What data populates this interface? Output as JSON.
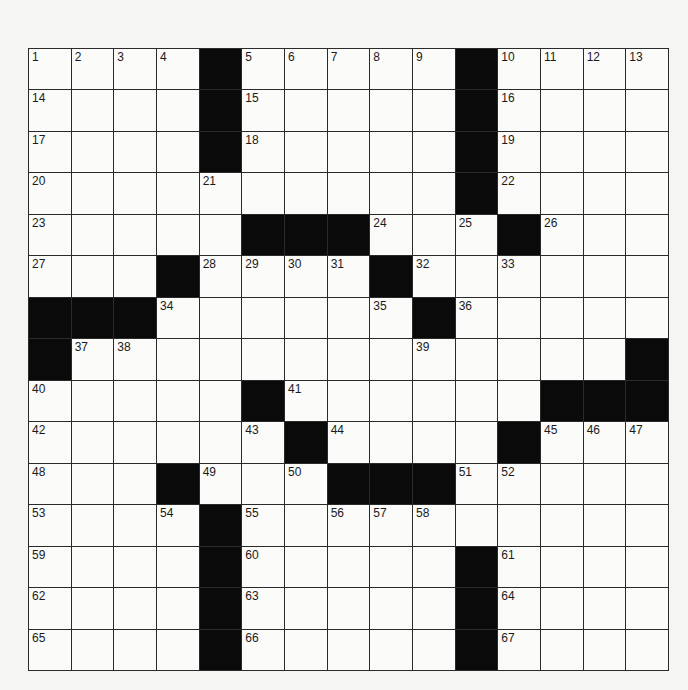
{
  "puzzle": {
    "rows": 15,
    "cols": 15,
    "layout": [
      "1,2,3,4,#,5,6,7,8,9,#,10,11,12,13",
      "14,.,.,.,#,15,.,.,.,.,#,16,.,.,.",
      "17,.,.,.,#,18,.,.,.,.,#,19,.,.,.",
      "20,.,.,.,21,.,.,.,.,.,#,22,.,.,.",
      "23,.,.,.,.,#,#,#,24,.,25,#,26,.,.",
      "27,.,.,#,28,29,30,31,#,32,.,33,.,.,.",
      "#,#,#,34,.,.,.,.,35,#,36,.,.,.,.",
      "#,37,38,.,.,.,.,.,.,39,.,.,.,.,#",
      "40,.,.,.,.,#,41,.,.,.,.,.,#,#,#",
      "42,.,.,.,.,43,#,44,.,.,.,#,45,46,47",
      "48,.,.,#,49,.,50,#,#,#,51,52,.,.,.",
      "53,.,.,54,#,55,.,56,57,58,.,.,.,.,.",
      "59,.,.,.,#,60,.,.,.,.,#,61,.,.,.",
      "62,.,.,.,#,63,.,.,.,.,#,64,.,.,.",
      "65,.,.,.,#,66,.,.,.,.,#,67,.,.,."
    ],
    "colors": {
      "block": "#0a0a0a",
      "cell": "#fbfbf9",
      "line": "#2a2a2a"
    }
  }
}
